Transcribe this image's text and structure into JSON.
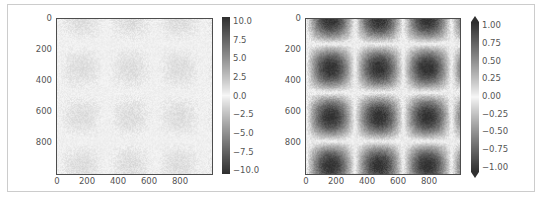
{
  "chart_data": [
    {
      "type": "heatmap",
      "title": "",
      "description": "Image of 10*sin(x)*cos(y) style field plus noise, shown with colormap range -10..10 (appears faint)",
      "function": "sin(x)*cos(y)",
      "x_ticks": [
        "0",
        "200",
        "400",
        "600",
        "800"
      ],
      "y_ticks": [
        "0",
        "200",
        "400",
        "600",
        "800"
      ],
      "extent": [
        0,
        1000,
        1000,
        0
      ],
      "clim": [
        -10,
        10
      ],
      "colorbar": {
        "ticks": [
          "10.0",
          "7.5",
          "5.0",
          "2.5",
          "0.0",
          "−2.5",
          "−5.0",
          "−7.5",
          "−10.0"
        ],
        "values": [
          10,
          7.5,
          5,
          2.5,
          0,
          -2.5,
          -5,
          -7.5,
          -10
        ],
        "extend": "neither"
      },
      "colormap": "diverging gray (dark at extremes, white at center)"
    },
    {
      "type": "heatmap",
      "title": "",
      "description": "Image of sin(x)*cos(y) with noise, colormap range -1..1, extended colorbar",
      "function": "sin(x)*cos(y)",
      "x_ticks": [
        "0",
        "200",
        "400",
        "600",
        "800"
      ],
      "y_ticks": [
        "0",
        "200",
        "400",
        "600",
        "800"
      ],
      "extent": [
        0,
        1000,
        1000,
        0
      ],
      "clim": [
        -1,
        1
      ],
      "colorbar": {
        "ticks": [
          "1.00",
          "0.75",
          "0.50",
          "0.25",
          "0.00",
          "−0.25",
          "−0.50",
          "−0.75",
          "−1.00"
        ],
        "values": [
          1,
          0.75,
          0.5,
          0.25,
          0,
          -0.25,
          -0.5,
          -0.75,
          -1
        ],
        "extend": "both"
      },
      "colormap": "diverging gray (dark at extremes, white at center)"
    }
  ],
  "render": {
    "panels": [
      {
        "amplitude": 1.0,
        "clim": 10,
        "noise": 0.5
      },
      {
        "amplitude": 1.0,
        "clim": 1,
        "noise": 0.08
      }
    ],
    "dark_hex": "#303030",
    "light_hex": "#f7f7f7"
  }
}
